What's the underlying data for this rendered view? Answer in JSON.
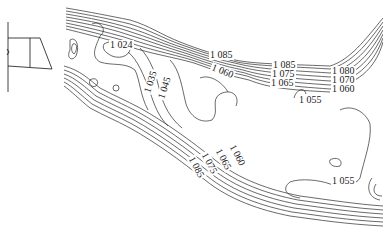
{
  "figure": {
    "type": "contour-map",
    "inset": {
      "description": "cross-section trapezoid sketch",
      "shape": "trapezoid"
    },
    "contour_labels": [
      {
        "id": "l1024",
        "text": "1 024",
        "x": 109,
        "y": 44,
        "rot": 0
      },
      {
        "id": "l1035",
        "text": "1 035",
        "x": 148,
        "y": 90,
        "rot": -72
      },
      {
        "id": "l1045",
        "text": "1 045",
        "x": 161,
        "y": 95,
        "rot": -72
      },
      {
        "id": "l1085a",
        "text": "1 085",
        "x": 209,
        "y": 53,
        "rot": 0
      },
      {
        "id": "l1060a",
        "text": "1 060",
        "x": 213,
        "y": 66,
        "rot": 22
      },
      {
        "id": "l1085b",
        "text": "1 085",
        "x": 272,
        "y": 63,
        "rot": 0
      },
      {
        "id": "l1075",
        "text": "1 075",
        "x": 271,
        "y": 72,
        "rot": 0
      },
      {
        "id": "l1065",
        "text": "1 065",
        "x": 270,
        "y": 81,
        "rot": 0
      },
      {
        "id": "l1080",
        "text": "1 080",
        "x": 331,
        "y": 70,
        "rot": 0
      },
      {
        "id": "l1070",
        "text": "1 070",
        "x": 331,
        "y": 79,
        "rot": 0
      },
      {
        "id": "l1060b",
        "text": "1 060",
        "x": 331,
        "y": 88,
        "rot": 0
      },
      {
        "id": "l1055a",
        "text": "1 055",
        "x": 298,
        "y": 97,
        "rot": 0
      },
      {
        "id": "l1060c",
        "text": "1 060",
        "x": 234,
        "y": 148,
        "rot": 62
      },
      {
        "id": "l1065b",
        "text": "1 065",
        "x": 220,
        "y": 152,
        "rot": 62
      },
      {
        "id": "l1075b",
        "text": "1 075",
        "x": 206,
        "y": 155,
        "rot": 62
      },
      {
        "id": "l1085c",
        "text": "1 085",
        "x": 193,
        "y": 158,
        "rot": 62
      },
      {
        "id": "l1055b",
        "text": "1 055",
        "x": 331,
        "y": 179,
        "rot": 0
      }
    ],
    "colors": {
      "line": "#2a2a2a",
      "background": "#ffffff"
    }
  }
}
